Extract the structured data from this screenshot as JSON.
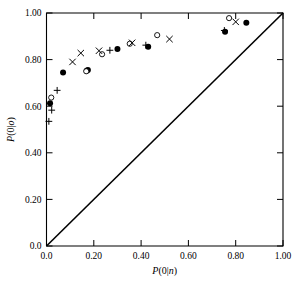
{
  "chart_data": {
    "type": "scatter",
    "title": "",
    "xlabel": "P(0|n)",
    "ylabel": "P(0|o)",
    "xlim": [
      0.0,
      1.0
    ],
    "ylim": [
      0.0,
      1.0
    ],
    "grid": false,
    "legend_position": "none",
    "xticks": [
      "0.0",
      "0.20",
      "0.40",
      "0.60",
      "0.80",
      "1.00"
    ],
    "xtick_values": [
      0.0,
      0.2,
      0.4,
      0.6,
      0.8,
      1.0
    ],
    "yticks": [
      "0.0",
      "0.20",
      "0.40",
      "0.60",
      "0.80",
      "1.00"
    ],
    "ytick_values": [
      0.0,
      0.2,
      0.4,
      0.6,
      0.8,
      1.0
    ],
    "reference_line": {
      "name": "diagonal-identity-line",
      "from": [
        0.0,
        0.0
      ],
      "to": [
        1.0,
        1.0
      ]
    },
    "series": [
      {
        "name": "filled-circle",
        "marker": "filled-circle",
        "color": "#000000",
        "points": [
          [
            0.015,
            0.613
          ],
          [
            0.07,
            0.745
          ],
          [
            0.17,
            0.752
          ],
          [
            0.175,
            0.755
          ],
          [
            0.3,
            0.845
          ],
          [
            0.43,
            0.855
          ],
          [
            0.755,
            0.92
          ],
          [
            0.845,
            0.958
          ]
        ]
      },
      {
        "name": "open-circle",
        "marker": "open-circle",
        "color": "#000000",
        "points": [
          [
            0.02,
            0.637
          ],
          [
            0.168,
            0.75
          ],
          [
            0.235,
            0.823
          ],
          [
            0.352,
            0.868
          ],
          [
            0.468,
            0.905
          ],
          [
            0.772,
            0.978
          ]
        ]
      },
      {
        "name": "cross",
        "marker": "x",
        "color": "#000000",
        "points": [
          [
            0.11,
            0.79
          ],
          [
            0.145,
            0.828
          ],
          [
            0.222,
            0.838
          ],
          [
            0.362,
            0.872
          ],
          [
            0.52,
            0.888
          ],
          [
            0.8,
            0.962
          ]
        ]
      },
      {
        "name": "plus",
        "marker": "plus",
        "color": "#000000",
        "points": [
          [
            0.01,
            0.535
          ],
          [
            0.022,
            0.583
          ],
          [
            0.045,
            0.668
          ],
          [
            0.268,
            0.84
          ],
          [
            0.42,
            0.862
          ],
          [
            0.752,
            0.925
          ]
        ]
      }
    ]
  },
  "axes": {
    "x_title": "P(0|n)",
    "y_title": "P(0|o)"
  }
}
